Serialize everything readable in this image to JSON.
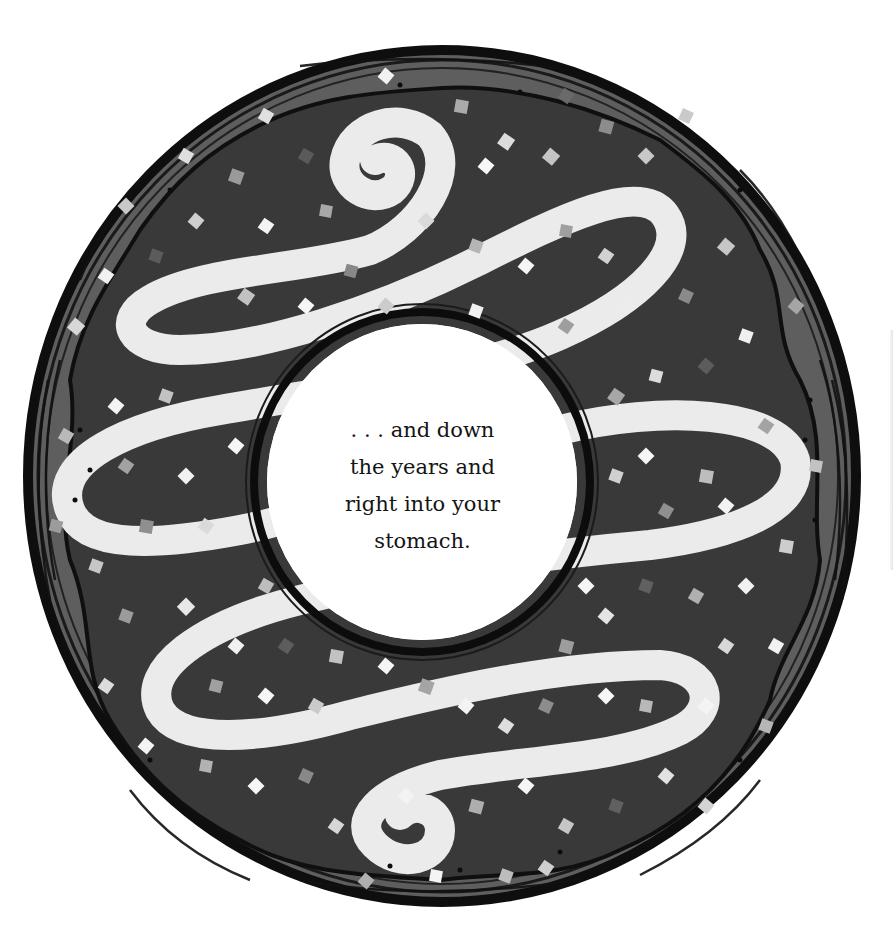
{
  "illustration": {
    "subject": "frosted donut with sprinkles",
    "style": "grayscale cut-paper collage",
    "colors": {
      "background": "#ffffff",
      "frosting": "#3a3a3a",
      "crust": "#6e6e6e",
      "outline": "#121212",
      "icing_swirl": "#e9e9e9",
      "hole": "#ffffff",
      "sprinkle_shades": [
        "#f4f4f4",
        "#c8c8c8",
        "#a5a5a5",
        "#8a8a8a",
        "#5a5a5a"
      ]
    }
  },
  "caption": {
    "lines": [
      ". . . and down",
      "the years and",
      "right into your",
      "stomach."
    ]
  }
}
